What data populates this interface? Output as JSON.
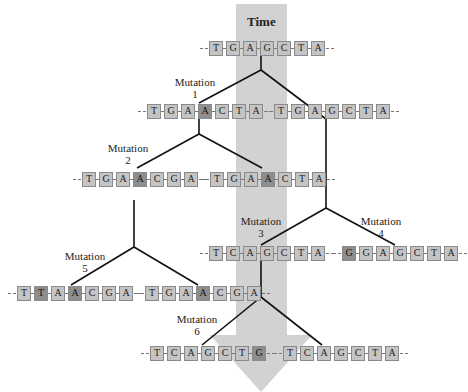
{
  "title": "Time",
  "colors": {
    "time_band": "#d2d2d2",
    "base_fill": "#c4c4c4",
    "mutated_base_fill": "#8e8e8e",
    "branch_line": "#111111"
  },
  "sequences": [
    {
      "id": "root",
      "bases": [
        "T",
        "G",
        "A",
        "G",
        "C",
        "T",
        "A"
      ],
      "mutated": []
    },
    {
      "id": "m1",
      "bases": [
        "T",
        "G",
        "A",
        "A",
        "C",
        "T",
        "A"
      ],
      "mutated": [
        3
      ]
    },
    {
      "id": "r1",
      "bases": [
        "T",
        "G",
        "A",
        "G",
        "C",
        "T",
        "A"
      ],
      "mutated": []
    },
    {
      "id": "m2",
      "bases": [
        "T",
        "G",
        "A",
        "A",
        "C",
        "G",
        "A"
      ],
      "mutated": [
        3,
        5
      ]
    },
    {
      "id": "m1b",
      "bases": [
        "T",
        "G",
        "A",
        "A",
        "C",
        "T",
        "A"
      ],
      "mutated": [
        3
      ]
    },
    {
      "id": "m3",
      "bases": [
        "T",
        "C",
        "A",
        "G",
        "C",
        "T",
        "A"
      ],
      "mutated": [
        1
      ]
    },
    {
      "id": "m4",
      "bases": [
        "G",
        "G",
        "A",
        "G",
        "C",
        "T",
        "A"
      ],
      "mutated": [
        0
      ]
    },
    {
      "id": "m5",
      "bases": [
        "T",
        "T",
        "A",
        "A",
        "C",
        "G",
        "A"
      ],
      "mutated": [
        1,
        3,
        5
      ]
    },
    {
      "id": "m2b",
      "bases": [
        "T",
        "G",
        "A",
        "A",
        "C",
        "G",
        "A"
      ],
      "mutated": [
        3,
        5
      ]
    },
    {
      "id": "m6",
      "bases": [
        "T",
        "C",
        "A",
        "G",
        "C",
        "T",
        "G"
      ],
      "mutated": [
        1,
        6
      ]
    },
    {
      "id": "m3b",
      "bases": [
        "T",
        "C",
        "A",
        "G",
        "C",
        "T",
        "A"
      ],
      "mutated": [
        1
      ]
    }
  ],
  "mutation_labels": [
    {
      "id": "mutation-1",
      "word": "Mutation",
      "number": "1"
    },
    {
      "id": "mutation-2",
      "word": "Mutation",
      "number": "2"
    },
    {
      "id": "mutation-3",
      "word": "Mutation",
      "number": "3"
    },
    {
      "id": "mutation-4",
      "word": "Mutation",
      "number": "4"
    },
    {
      "id": "mutation-5",
      "word": "Mutation",
      "number": "5"
    },
    {
      "id": "mutation-6",
      "word": "Mutation",
      "number": "6"
    }
  ]
}
